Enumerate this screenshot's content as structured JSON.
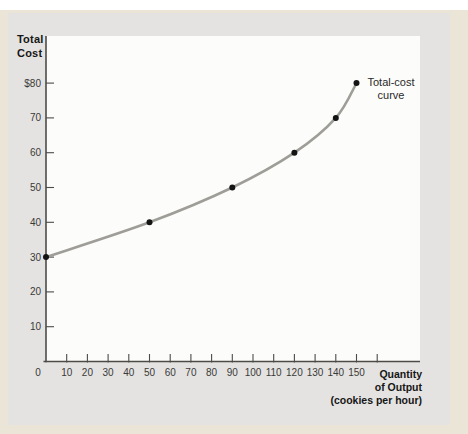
{
  "colors": {
    "page_bg": "#ffffff",
    "band_bg": "#eae5d6",
    "panel_bg": "#e4e3e1",
    "plot_bg": "#fcfcfa",
    "axis": "#4c4b49",
    "tick_text": "#3a3a38",
    "title_text": "#161616",
    "annotation_text": "#2a2a2a",
    "curve": "#9f9d98",
    "point": "#141414"
  },
  "labels": {
    "y_axis_title": "Total Cost",
    "y_axis_title_lines": [
      "Total",
      "Cost"
    ],
    "x_axis_title": "Quantity of Output (cookies per hour)",
    "x_axis_title_lines": [
      "Quantity",
      "of Output",
      "(cookies per hour)"
    ],
    "annotation": "Total-cost curve",
    "annotation_lines": [
      "Total-cost",
      "curve"
    ]
  },
  "chart_data": {
    "type": "line",
    "title": "",
    "xlabel": "Quantity of Output (cookies per hour)",
    "ylabel": "Total Cost",
    "series": [
      {
        "name": "Total-cost curve",
        "points": [
          [
            0,
            30
          ],
          [
            50,
            40
          ],
          [
            90,
            50
          ],
          [
            120,
            60
          ],
          [
            140,
            70
          ],
          [
            150,
            80
          ]
        ]
      }
    ],
    "x_ticks": [
      0,
      10,
      20,
      30,
      40,
      50,
      60,
      70,
      80,
      90,
      100,
      110,
      120,
      130,
      140,
      150
    ],
    "x_ticks_unlabeled": [
      160
    ],
    "y_ticks": [
      {
        "value": 10,
        "label": "10"
      },
      {
        "value": 20,
        "label": "20"
      },
      {
        "value": 30,
        "label": "30"
      },
      {
        "value": 40,
        "label": "40"
      },
      {
        "value": 50,
        "label": "50"
      },
      {
        "value": 60,
        "label": "60"
      },
      {
        "value": 70,
        "label": "70"
      },
      {
        "value": 80,
        "label": "$80"
      }
    ],
    "xlim": [
      0,
      163
    ],
    "ylim": [
      0,
      93
    ],
    "grid": false,
    "legend_position": "none",
    "annotation": "Total-cost curve"
  }
}
